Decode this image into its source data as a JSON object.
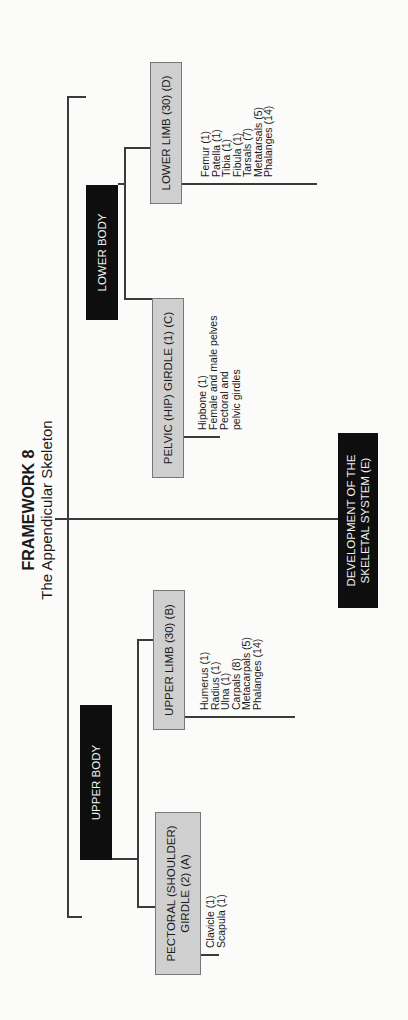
{
  "title": {
    "heading": "FRAMEWORK 8",
    "subheading": "The Appendicular Skeleton"
  },
  "colors": {
    "dark_box": "#0e0e0e",
    "gray_box": "#cfcfcf",
    "line": "#3a3a3a"
  },
  "nodes": {
    "upper_body": {
      "label": "UPPER BODY"
    },
    "lower_body": {
      "label": "LOWER BODY"
    },
    "development": {
      "label": "DEVELOPMENT OF THE SKELETAL SYSTEM (E)"
    },
    "pectoral_girdle": {
      "label": "PECTORAL (SHOULDER) GIRDLE (2) (A)",
      "items": [
        "Clavicle (1)",
        "Scapula (1)"
      ]
    },
    "upper_limb": {
      "label": "UPPER LIMB (30) (B)",
      "items": [
        "Humerus (1)",
        "Radius (1)",
        "Ulna (1)",
        "Carpals (8)",
        "Metacarpals (5)",
        "Phalanges (14)"
      ]
    },
    "pelvic_girdle": {
      "label": "PELVIC (HIP) GIRDLE (1) (C)",
      "items": [
        "Hipbone (1)",
        "Female and male pelves",
        "Pectoral and pelvic girdles"
      ]
    },
    "lower_limb": {
      "label": "LOWER LIMB (30) (D)",
      "items": [
        "Femur (1)",
        "Patella (1)",
        "Tibia (1)",
        "Fibula (1)",
        "Tarsals (7)",
        "Metatarsals (5)",
        "Phalanges (14)"
      ]
    }
  }
}
